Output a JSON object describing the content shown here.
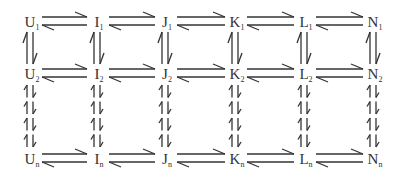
{
  "diagram": {
    "title": "",
    "colors": {
      "stroke": "#333333",
      "text": "#333333",
      "background": "#ffffff"
    },
    "columns": [
      {
        "letter": "U",
        "x": 30
      },
      {
        "letter": "I",
        "x": 97
      },
      {
        "letter": "J",
        "x": 165
      },
      {
        "letter": "K",
        "x": 235
      },
      {
        "letter": "L",
        "x": 304
      },
      {
        "letter": "N",
        "x": 373
      }
    ],
    "rows": [
      {
        "sub": "1",
        "y": 22
      },
      {
        "sub": "2",
        "y": 74
      },
      {
        "sub": "n",
        "y": 159
      }
    ],
    "nodes": {
      "U1": "U",
      "U1_sub": "1",
      "I1": "I",
      "I1_sub": "1",
      "J1": "J",
      "J1_sub": "1",
      "K1": "K",
      "K1_sub": "1",
      "L1": "L",
      "L1_sub": "1",
      "N1": "N",
      "N1_sub": "1",
      "U2": "U",
      "U2_sub": "2",
      "I2": "I",
      "I2_sub": "2",
      "J2": "J",
      "J2_sub": "2",
      "K2": "K",
      "K2_sub": "2",
      "L2": "L",
      "L2_sub": "2",
      "N2": "N",
      "N2_sub": "2",
      "Un": "U",
      "Un_sub": "n",
      "In": "I",
      "In_sub": "n",
      "Jn": "J",
      "Jn_sub": "n",
      "Kn": "K",
      "Kn_sub": "n",
      "Ln": "L",
      "Ln_sub": "n",
      "Nn": "N",
      "Nn_sub": "n"
    },
    "edges": {
      "horizontal": "reversible pair (forward right, backward left) between adjacent nodes in each row",
      "vertical_solid": "reversible pair between row 1 and row 2 in each column",
      "vertical_dashed": "reversible dashed pair between row 2 and row n in each column"
    }
  }
}
